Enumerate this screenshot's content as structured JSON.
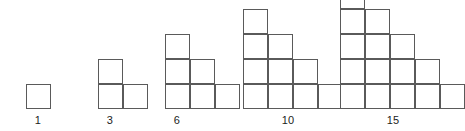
{
  "diagram": {
    "type": "staircase-triangular-numbers",
    "background_color": "#ffffff",
    "line_color": "#5a5a5a",
    "label_color": "#1c1c1c",
    "cell_size_px": 25,
    "baseline_y_px": 109,
    "figures": [
      {
        "index": 1,
        "label": "1",
        "rows": [
          1
        ],
        "total_cells": 1,
        "left_px": 26,
        "width_px": 25,
        "height_px": 25,
        "label_center_x_px": 38
      },
      {
        "index": 2,
        "label": "3",
        "rows": [
          2,
          1
        ],
        "total_cells": 3,
        "left_px": 98,
        "width_px": 50,
        "height_px": 50,
        "label_center_x_px": 110
      },
      {
        "index": 3,
        "label": "6",
        "rows": [
          3,
          2,
          1
        ],
        "total_cells": 6,
        "left_px": 165,
        "width_px": 75,
        "height_px": 75,
        "label_center_x_px": 177
      },
      {
        "index": 4,
        "label": "10",
        "rows": [
          4,
          3,
          2,
          1
        ],
        "total_cells": 10,
        "left_px": 243,
        "width_px": 100,
        "height_px": 100,
        "label_center_x_px": 288
      },
      {
        "index": 5,
        "label": "15",
        "rows": [
          5,
          4,
          3,
          2,
          1
        ],
        "total_cells": 15,
        "left_px": 340,
        "width_px": 125,
        "height_px": 125,
        "label_center_x_px": 393
      }
    ]
  },
  "chart_data": {
    "type": "bar",
    "title": "",
    "xlabel": "",
    "ylabel": "",
    "categories": [
      "1",
      "3",
      "6",
      "10",
      "15"
    ],
    "values": [
      1,
      3,
      6,
      10,
      15
    ],
    "annotations": [
      "1",
      "3",
      "6",
      "10",
      "15"
    ]
  }
}
